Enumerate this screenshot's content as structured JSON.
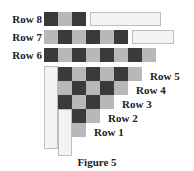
{
  "figure": {
    "caption": "Figure 5",
    "colors": {
      "dark": "#3a3a3a",
      "light": "#b8b8b8",
      "blank": "#f4f4f4"
    },
    "rows": [
      {
        "label": "Row 8",
        "cells": [
          "D",
          "L",
          "D"
        ]
      },
      {
        "label": "Row 7",
        "cells": [
          "L",
          "D",
          "L",
          "D",
          "L",
          "D"
        ]
      },
      {
        "label": "Row 6",
        "cells": [
          "D",
          "L",
          "D",
          "L",
          "D",
          "L",
          "D",
          "L"
        ]
      },
      {
        "label": "Row 5",
        "cells": [
          "D",
          "L",
          "D",
          "L",
          "D",
          "L"
        ]
      },
      {
        "label": "Row 4",
        "cells": [
          "L",
          "D",
          "L",
          "D",
          "L"
        ]
      },
      {
        "label": "Row 3",
        "cells": [
          "D",
          "L",
          "D",
          "L"
        ]
      },
      {
        "label": "Row 2",
        "cells": [
          "D",
          "L"
        ]
      },
      {
        "label": "Row 1",
        "cells": [
          "L"
        ]
      }
    ]
  }
}
